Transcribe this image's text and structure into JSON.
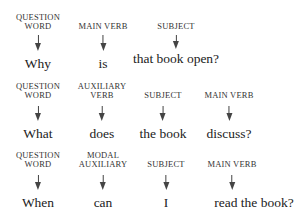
{
  "rows": [
    {
      "items": [
        {
          "label": "QUESTION WORD",
          "label_lines": [
            "QUESTION",
            "WORD"
          ],
          "word": "Why"
        },
        {
          "label": "MAIN VERB",
          "label_lines": [
            "MAIN VERB"
          ],
          "word": "is"
        },
        {
          "label": "SUBJECT",
          "label_lines": [
            "SUBJECT"
          ],
          "word": "that book open?"
        }
      ]
    },
    {
      "items": [
        {
          "label": "QUESTION WORD",
          "label_lines": [
            "QUESTION",
            "WORD"
          ],
          "word": "What"
        },
        {
          "label": "AUXILIARY VERB",
          "label_lines": [
            "AUXILIARY",
            "VERB"
          ],
          "word": "does"
        },
        {
          "label": "SUBJECT",
          "label_lines": [
            "SUBJECT"
          ],
          "word": "the book"
        },
        {
          "label": "MAIN VERB",
          "label_lines": [
            "MAIN VERB"
          ],
          "word": "discuss?"
        }
      ]
    },
    {
      "items": [
        {
          "label": "QUESTION WORD",
          "label_lines": [
            "QUESTION",
            "WORD"
          ],
          "word": "When"
        },
        {
          "label": "MODAL AUXILIARY",
          "label_lines": [
            "MODAL",
            "AUXILIARY"
          ],
          "word": "can"
        },
        {
          "label": "SUBJECT",
          "label_lines": [
            "SUBJECT"
          ],
          "word": "I"
        },
        {
          "label": "MAIN VERB",
          "label_lines": [
            "MAIN VERB"
          ],
          "word": "read the book?"
        }
      ]
    }
  ]
}
